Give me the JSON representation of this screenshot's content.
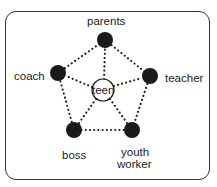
{
  "diagram": {
    "center": {
      "id": "teen",
      "label": "teen",
      "x": 103,
      "y": 90,
      "r": 11
    },
    "nodes": [
      {
        "id": "parents",
        "label": "parents",
        "x": 105,
        "y": 40
      },
      {
        "id": "teacher",
        "label": "teacher",
        "x": 150,
        "y": 76
      },
      {
        "id": "youth-worker",
        "label_line1": "youth",
        "label_line2": "worker",
        "x": 132,
        "y": 130
      },
      {
        "id": "boss",
        "label": "boss",
        "x": 74,
        "y": 130
      },
      {
        "id": "coach",
        "label": "coach",
        "x": 58,
        "y": 73
      }
    ],
    "edges": [
      [
        "parents",
        "teacher"
      ],
      [
        "teacher",
        "youth-worker"
      ],
      [
        "youth-worker",
        "boss"
      ],
      [
        "boss",
        "coach"
      ],
      [
        "coach",
        "parents"
      ],
      [
        "teen",
        "parents"
      ],
      [
        "teen",
        "teacher"
      ],
      [
        "teen",
        "youth-worker"
      ],
      [
        "teen",
        "boss"
      ],
      [
        "teen",
        "coach"
      ]
    ],
    "colors": {
      "node": "#1a1a1a",
      "line": "#1a1a1a",
      "frame": "#333333"
    }
  }
}
